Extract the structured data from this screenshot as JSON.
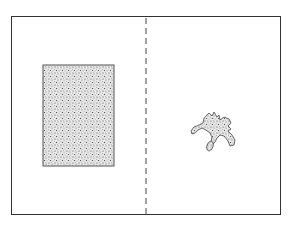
{
  "diagram": {
    "frame": {
      "x": 11,
      "y": 16,
      "width": 270,
      "height": 199,
      "stroke": "#333333"
    },
    "divider": {
      "x": 146,
      "style": "dashed",
      "stroke": "#444444"
    },
    "left_panel": {
      "shape": "rectangle",
      "fill": "stippled",
      "rect": {
        "x": 43,
        "y": 65,
        "width": 71,
        "height": 101
      }
    },
    "right_panel": {
      "shape": "irregular-blob",
      "fill": "stippled",
      "center": {
        "x": 212,
        "y": 130
      }
    }
  }
}
